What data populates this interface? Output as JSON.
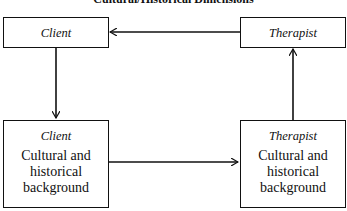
{
  "title": "Cultural/Historical Dimensions",
  "boxes": {
    "top_left": {
      "role": "Client"
    },
    "top_right": {
      "role": "Therapist"
    },
    "bottom_left": {
      "role": "Client",
      "desc_lines": [
        "Cultural and",
        "historical",
        "background"
      ]
    },
    "bottom_right": {
      "role": "Therapist",
      "desc_lines": [
        "Cultural and",
        "historical",
        "background"
      ]
    }
  },
  "edges": [
    {
      "from": "top_right",
      "to": "top_left"
    },
    {
      "from": "top_left",
      "to": "bottom_left"
    },
    {
      "from": "bottom_left",
      "to": "bottom_right"
    },
    {
      "from": "bottom_right",
      "to": "top_right"
    }
  ]
}
